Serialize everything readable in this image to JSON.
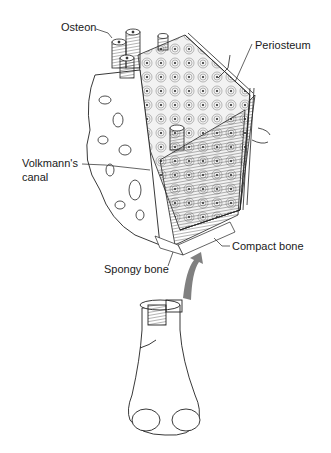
{
  "diagram": {
    "type": "anatomical-illustration",
    "labels": {
      "osteon": "Osteon",
      "periosteum": "Periosteum",
      "volkmanns_canal_line1": "Volkmann's",
      "volkmanns_canal_line2": "canal",
      "compact_bone": "Compact bone",
      "spongy_bone": "Spongy bone"
    },
    "colors": {
      "line": "#1a1a1a",
      "arrow": "#808080",
      "background": "#ffffff",
      "hatch": "#555555"
    }
  }
}
